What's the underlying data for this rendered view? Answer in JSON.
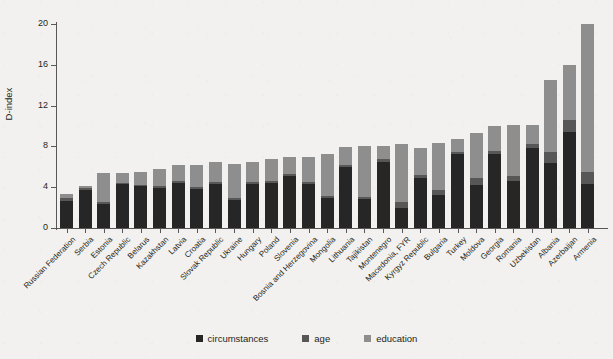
{
  "chart_data": {
    "type": "bar",
    "subtype": "stacked-vertical",
    "title": "",
    "xlabel": "",
    "ylabel": "D-index",
    "ylim": [
      0,
      20
    ],
    "yticks": [
      0,
      4,
      8,
      12,
      16,
      20
    ],
    "grid": false,
    "legend_position": "bottom-center",
    "categories": [
      "Russian Federation",
      "Serbia",
      "Estonia",
      "Czech Republic",
      "Belarus",
      "Kazakhstan",
      "Latvia",
      "Croatia",
      "Slovak Republic",
      "Ukraine",
      "Hungary",
      "Poland",
      "Slovenia",
      "Bosnia and Herzegovina",
      "Mongolia",
      "Lithuania",
      "Tajikistan",
      "Montenegro",
      "Macedonia, FYR",
      "Kyrgyz Republic",
      "Bulgaria",
      "Turkey",
      "Moldova",
      "Georgia",
      "Romania",
      "Uzbekistan",
      "Albania",
      "Azerbaijan",
      "Armenia"
    ],
    "series": [
      {
        "name": "circumstances",
        "color": "#262626",
        "values": [
          2.6,
          3.7,
          2.4,
          4.3,
          4.1,
          3.9,
          4.4,
          3.8,
          4.3,
          2.7,
          4.3,
          4.4,
          5.1,
          4.3,
          2.9,
          6.0,
          2.8,
          6.5,
          2.0,
          4.9,
          3.2,
          7.3,
          4.2,
          7.3,
          4.6,
          7.8,
          6.4,
          9.4,
          4.3
        ]
      },
      {
        "name": "age",
        "color": "#575757",
        "values": [
          0.3,
          0.2,
          0.2,
          0.1,
          0.1,
          0.2,
          0.2,
          0.2,
          0.2,
          0.2,
          0.2,
          0.2,
          0.2,
          0.2,
          0.2,
          0.2,
          0.2,
          0.3,
          0.6,
          0.3,
          0.5,
          0.2,
          0.7,
          0.3,
          0.5,
          0.4,
          1.1,
          1.2,
          1.2
        ]
      },
      {
        "name": "education",
        "color": "#8e8e8e",
        "values": [
          0.4,
          0.2,
          2.8,
          1.0,
          1.3,
          1.7,
          1.6,
          2.2,
          2.0,
          3.4,
          2.0,
          2.2,
          1.7,
          2.5,
          4.2,
          1.7,
          5.0,
          1.2,
          5.6,
          2.6,
          4.6,
          1.2,
          4.4,
          2.4,
          5.0,
          1.9,
          7.0,
          5.4,
          14.5
        ]
      }
    ],
    "totals": [
      3.3,
      4.1,
      5.4,
      5.4,
      5.5,
      5.8,
      6.2,
      6.2,
      6.5,
      6.3,
      6.5,
      6.8,
      7.0,
      7.0,
      7.3,
      7.9,
      8.0,
      8.0,
      8.2,
      7.8,
      8.3,
      8.7,
      9.3,
      10.0,
      10.1,
      10.1,
      14.5,
      16.0,
      20.0
    ]
  },
  "axis": {
    "y_title": "D-index",
    "y_tick_labels": [
      "0",
      "4",
      "8",
      "12",
      "16",
      "20"
    ]
  },
  "legend": {
    "items": [
      {
        "label": "circumstances",
        "color": "#262626"
      },
      {
        "label": "age",
        "color": "#575757"
      },
      {
        "label": "education",
        "color": "#8e8e8e"
      }
    ]
  },
  "colors": {
    "background": "#f2f1ef",
    "axis": "#58585a",
    "text": "#231f20",
    "circumstances": "#262626",
    "age": "#575757",
    "education": "#8e8e8e"
  }
}
